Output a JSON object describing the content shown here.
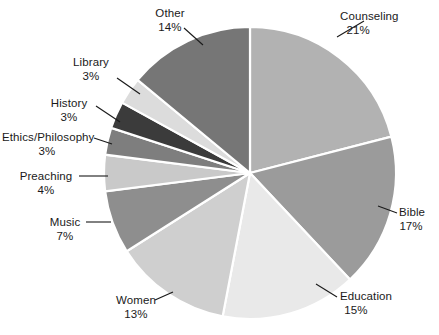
{
  "chart_data": {
    "type": "pie",
    "title": "",
    "subtitle": "",
    "xlabel": "",
    "ylabel": "",
    "legend_position": "none",
    "grid": false,
    "units": "percent",
    "start_angle_deg": 0,
    "direction": "clockwise",
    "categories": [
      "Counseling",
      "Bible",
      "Education",
      "Women",
      "Music",
      "Preaching",
      "Ethics/Philosophy",
      "History",
      "Library",
      "Other"
    ],
    "values": [
      21,
      17,
      15,
      13,
      7,
      4,
      3,
      3,
      3,
      14
    ],
    "slices": [
      {
        "label": "Counseling",
        "value": 21,
        "pct_text": "21%",
        "color": "#b2b2b2"
      },
      {
        "label": "Bible",
        "value": 17,
        "pct_text": "17%",
        "color": "#9b9b9b"
      },
      {
        "label": "Education",
        "value": 15,
        "pct_text": "15%",
        "color": "#e9e9e9"
      },
      {
        "label": "Women",
        "value": 13,
        "pct_text": "13%",
        "color": "#cfcfcf"
      },
      {
        "label": "Music",
        "value": 7,
        "pct_text": "7%",
        "color": "#8e8e8e"
      },
      {
        "label": "Preaching",
        "value": 4,
        "pct_text": "4%",
        "color": "#c9c9c9"
      },
      {
        "label": "Ethics/Philosophy",
        "value": 3,
        "pct_text": "3%",
        "color": "#7e7e7e"
      },
      {
        "label": "History",
        "value": 3,
        "pct_text": "3%",
        "color": "#3b3b3b"
      },
      {
        "label": "Library",
        "value": 3,
        "pct_text": "3%",
        "color": "#dcdcdc"
      },
      {
        "label": "Other",
        "value": 14,
        "pct_text": "14%",
        "color": "#767676"
      }
    ]
  },
  "labels": {
    "counseling": {
      "name": "Counseling",
      "pct": "21%"
    },
    "bible": {
      "name": "Bible",
      "pct": "17%"
    },
    "education": {
      "name": "Education",
      "pct": "15%"
    },
    "women": {
      "name": "Women",
      "pct": "13%"
    },
    "music": {
      "name": "Music",
      "pct": "7%"
    },
    "preaching": {
      "name": "Preaching",
      "pct": "4%"
    },
    "ethics_philosophy": {
      "name": "Ethics/Philosophy",
      "pct": "3%"
    },
    "history": {
      "name": "History",
      "pct": "3%"
    },
    "library": {
      "name": "Library",
      "pct": "3%"
    },
    "other": {
      "name": "Other",
      "pct": "14%"
    }
  },
  "colors": {
    "background": "#ffffff",
    "text": "#1a1a1a",
    "slice_border": "#ffffff",
    "leader_line": "#1a1a1a"
  }
}
